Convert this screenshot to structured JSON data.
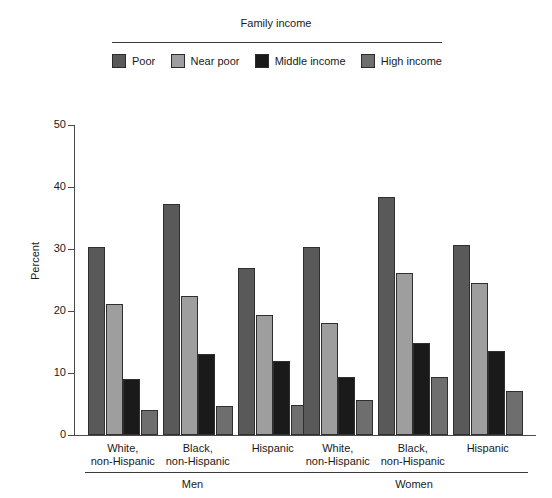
{
  "legend": {
    "title": "Family income",
    "items": [
      {
        "label": "Poor",
        "color": "#595959",
        "key": "poor"
      },
      {
        "label": "Near poor",
        "color": "#9e9e9e",
        "key": "near_poor"
      },
      {
        "label": "Middle income",
        "color": "#1a1a1a",
        "key": "middle_income"
      },
      {
        "label": "High income",
        "color": "#6e6e6e",
        "key": "high_income"
      }
    ]
  },
  "axes": {
    "ylabel": "Percent",
    "yticks": [
      "0",
      "10",
      "20",
      "30",
      "40",
      "50"
    ],
    "ymin": 0,
    "ymax": 50
  },
  "groups": [
    {
      "sex": "Men",
      "label_line1": "White,",
      "label_line2": "non-Hispanic"
    },
    {
      "sex": "Men",
      "label_line1": "Black,",
      "label_line2": "non-Hispanic"
    },
    {
      "sex": "Men",
      "label_line1": "Hispanic",
      "label_line2": ""
    },
    {
      "sex": "Women",
      "label_line1": "White,",
      "label_line2": "non-Hispanic"
    },
    {
      "sex": "Women",
      "label_line1": "Black,",
      "label_line2": "non-Hispanic"
    },
    {
      "sex": "Women",
      "label_line1": "Hispanic",
      "label_line2": ""
    }
  ],
  "sections": [
    {
      "label": "Men"
    },
    {
      "label": "Women"
    }
  ],
  "chart_data": {
    "type": "bar",
    "title": "",
    "xlabel": "",
    "ylabel": "Percent",
    "ylim": [
      0,
      50
    ],
    "yticks": [
      0,
      10,
      20,
      30,
      40,
      50
    ],
    "grid": false,
    "legend_title": "Family income",
    "legend_position": "top",
    "categories": [
      "Men - White, non-Hispanic",
      "Men - Black, non-Hispanic",
      "Men - Hispanic",
      "Women - White, non-Hispanic",
      "Women - Black, non-Hispanic",
      "Women - Hispanic"
    ],
    "series": [
      {
        "name": "Poor",
        "color": "#595959",
        "values": [
          30.4,
          37.3,
          26.9,
          30.4,
          38.4,
          30.7
        ]
      },
      {
        "name": "Near poor",
        "color": "#9e9e9e",
        "values": [
          21.2,
          22.4,
          19.3,
          18.1,
          26.1,
          24.5
        ]
      },
      {
        "name": "Middle income",
        "color": "#1a1a1a",
        "values": [
          9.0,
          13.1,
          11.9,
          9.3,
          14.8,
          13.5
        ]
      },
      {
        "name": "High income",
        "color": "#6e6e6e",
        "values": [
          4.0,
          4.7,
          4.8,
          5.7,
          9.3,
          7.1
        ]
      }
    ]
  }
}
